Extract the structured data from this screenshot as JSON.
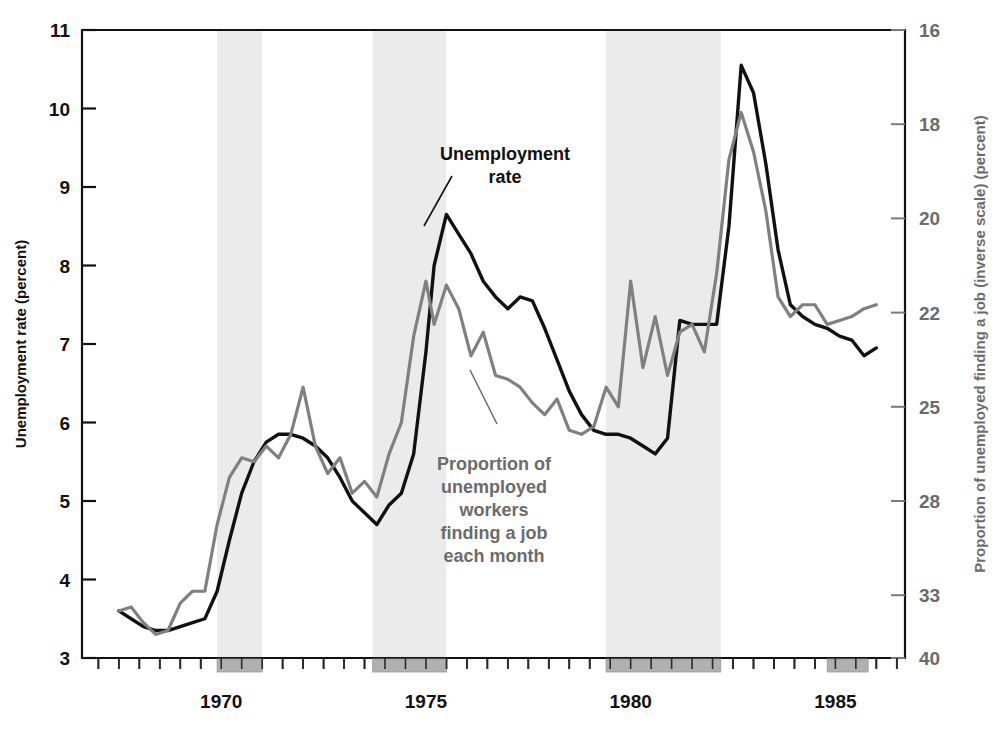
{
  "chart_data": {
    "type": "line",
    "title": "",
    "xlabel": "",
    "ylabel": "Unemployment rate (percent)",
    "y2label": "Proportion of unemployed finding a job (inverse scale) (percent)",
    "xlim": [
      1966.6,
      1986.7
    ],
    "ylim": [
      3,
      11
    ],
    "grid": false,
    "legend_position": "inline-annotations",
    "xticks": [
      1970,
      1975,
      1980,
      1985
    ],
    "xtick_labels": [
      "1970",
      "1975",
      "1980",
      "1985"
    ],
    "xminor_tick_interval": 0.5,
    "yticks": [
      3,
      4,
      5,
      6,
      7,
      8,
      9,
      10,
      11
    ],
    "ytick_labels": [
      "3",
      "4",
      "5",
      "6",
      "7",
      "8",
      "9",
      "10",
      "11"
    ],
    "y2ticks": [
      16,
      18,
      20,
      22,
      25,
      28,
      33,
      40
    ],
    "y2tick_labels": [
      "16",
      "18",
      "20",
      "22",
      "25",
      "28",
      "33",
      "40"
    ],
    "y2tick_positions_left_scale": [
      11,
      9.8,
      8.6,
      7.4,
      6.2,
      5.0,
      3.8,
      3.0
    ],
    "colors": {
      "unemployment_rate": "#111111",
      "job_finding": "#808080",
      "recession_band": "#ebebeb",
      "recession_bar": "#b0b0b0",
      "axis": "#111111",
      "right_axis_text": "#6b6b6b"
    },
    "recession_bands": [
      {
        "start": 1969.9,
        "end": 1971.0
      },
      {
        "start": 1973.7,
        "end": 1975.5
      },
      {
        "start": 1979.4,
        "end": 1982.2
      }
    ],
    "recession_bars": [
      {
        "start": 1969.9,
        "end": 1971.0
      },
      {
        "start": 1973.7,
        "end": 1975.5
      },
      {
        "start": 1979.4,
        "end": 1982.2
      },
      {
        "start": 1984.8,
        "end": 1985.8
      }
    ],
    "series": [
      {
        "name": "Unemployment rate",
        "color": "#111111",
        "axis": "left",
        "annotation": "Unemployment\nrate",
        "x": [
          1967.5,
          1967.8,
          1968.1,
          1968.4,
          1968.7,
          1969.0,
          1969.3,
          1969.6,
          1969.9,
          1970.2,
          1970.5,
          1970.8,
          1971.1,
          1971.4,
          1971.7,
          1972.0,
          1972.3,
          1972.6,
          1972.9,
          1973.2,
          1973.5,
          1973.8,
          1974.1,
          1974.4,
          1974.7,
          1975.0,
          1975.2,
          1975.5,
          1975.8,
          1976.1,
          1976.4,
          1976.7,
          1977.0,
          1977.3,
          1977.6,
          1977.9,
          1978.2,
          1978.5,
          1978.8,
          1979.1,
          1979.4,
          1979.7,
          1980.0,
          1980.3,
          1980.6,
          1980.9,
          1981.2,
          1981.5,
          1981.8,
          1982.1,
          1982.4,
          1982.7,
          1983.0,
          1983.3,
          1983.6,
          1983.9,
          1984.2,
          1984.5,
          1984.8,
          1985.1,
          1985.4,
          1985.7,
          1986.0
        ],
        "y": [
          3.6,
          3.5,
          3.4,
          3.35,
          3.35,
          3.4,
          3.45,
          3.5,
          3.85,
          4.5,
          5.1,
          5.5,
          5.75,
          5.85,
          5.85,
          5.8,
          5.7,
          5.55,
          5.3,
          5.0,
          4.85,
          4.7,
          4.95,
          5.1,
          5.6,
          6.9,
          8.0,
          8.65,
          8.4,
          8.15,
          7.8,
          7.6,
          7.45,
          7.6,
          7.55,
          7.2,
          6.8,
          6.4,
          6.1,
          5.9,
          5.85,
          5.85,
          5.8,
          5.7,
          5.6,
          5.8,
          7.3,
          7.25,
          7.25,
          7.25,
          8.5,
          10.55,
          10.2,
          9.3,
          8.2,
          7.5,
          7.35,
          7.25,
          7.2,
          7.1,
          7.05,
          6.85,
          6.95
        ]
      },
      {
        "name": "Proportion of unemployed workers finding a job each month",
        "color": "#808080",
        "axis": "right",
        "annotation": "Proportion of\nunemployed\nworkers\nfinding a job\neach month",
        "x": [
          1967.5,
          1967.8,
          1968.1,
          1968.4,
          1968.7,
          1969.0,
          1969.3,
          1969.6,
          1969.9,
          1970.2,
          1970.5,
          1970.8,
          1971.1,
          1971.4,
          1971.7,
          1972.0,
          1972.3,
          1972.6,
          1972.9,
          1973.2,
          1973.5,
          1973.8,
          1974.1,
          1974.4,
          1974.7,
          1975.0,
          1975.2,
          1975.5,
          1975.8,
          1976.1,
          1976.4,
          1976.7,
          1977.0,
          1977.3,
          1977.6,
          1977.9,
          1978.2,
          1978.5,
          1978.8,
          1979.1,
          1979.4,
          1979.7,
          1980.0,
          1980.3,
          1980.6,
          1980.9,
          1981.2,
          1981.5,
          1981.8,
          1982.1,
          1982.4,
          1982.7,
          1983.0,
          1983.3,
          1983.6,
          1983.9,
          1984.2,
          1984.5,
          1984.8,
          1985.1,
          1985.4,
          1985.7,
          1986.0
        ],
        "y_left_equiv": [
          3.6,
          3.65,
          3.45,
          3.3,
          3.35,
          3.7,
          3.85,
          3.85,
          4.7,
          5.3,
          5.55,
          5.5,
          5.7,
          5.55,
          5.85,
          6.45,
          5.7,
          5.35,
          5.55,
          5.1,
          5.25,
          5.05,
          5.6,
          6.0,
          7.1,
          7.8,
          7.25,
          7.75,
          7.45,
          6.85,
          7.15,
          6.6,
          6.55,
          6.45,
          6.25,
          6.1,
          6.3,
          5.9,
          5.85,
          5.95,
          6.45,
          6.2,
          7.8,
          6.7,
          7.35,
          6.6,
          7.15,
          7.25,
          6.9,
          7.9,
          9.35,
          9.95,
          9.45,
          8.7,
          7.6,
          7.35,
          7.5,
          7.5,
          7.25,
          7.3,
          7.35,
          7.45,
          7.5
        ]
      }
    ],
    "annotations": [
      {
        "name": "unemployment-rate-annotation",
        "lines": [
          "Unemployment",
          "rate"
        ],
        "color": "#111111",
        "x_px": 505,
        "y_px": 160,
        "align": "center"
      },
      {
        "name": "job-finding-annotation",
        "lines": [
          "Proportion of",
          "unemployed",
          "workers",
          "finding a job",
          "each month"
        ],
        "color": "#6b6b6b",
        "x_px": 494,
        "y_px": 470,
        "align": "center"
      }
    ]
  }
}
